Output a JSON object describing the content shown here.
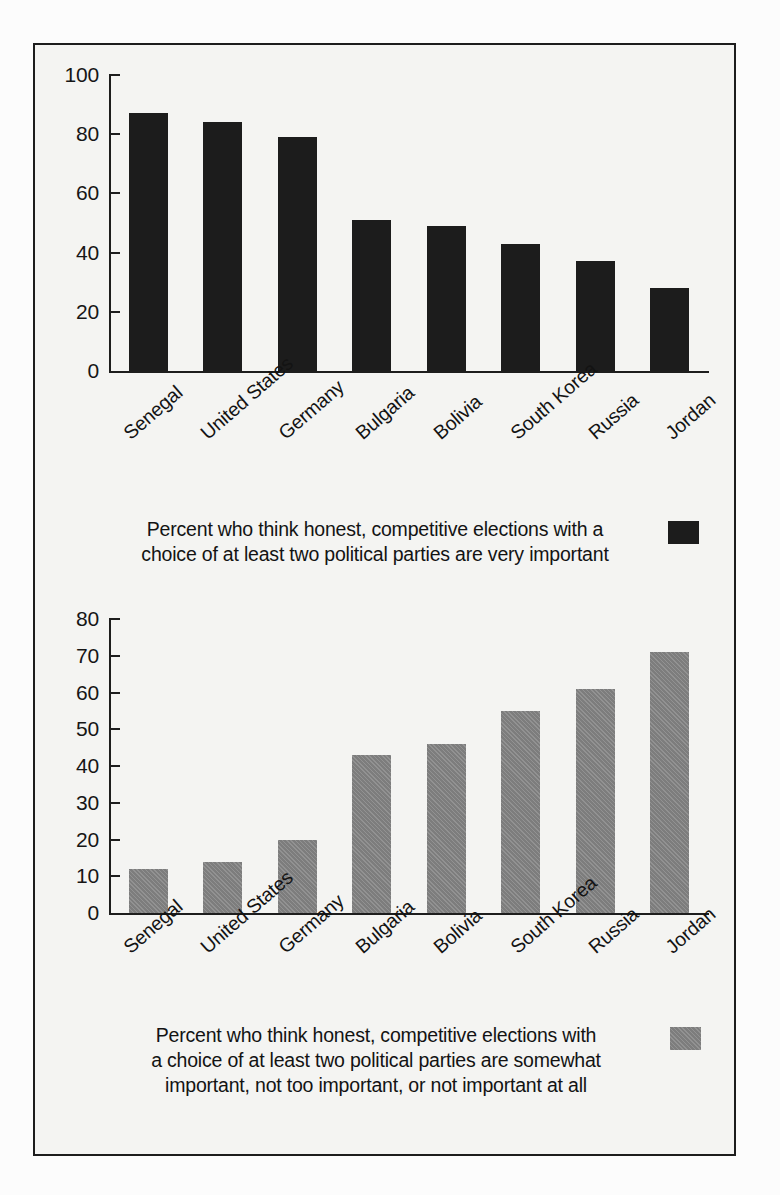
{
  "figure": {
    "background_color": "#f4f4f2",
    "border_color": "#1d1d1d",
    "dark_series_color": "#1c1c1c",
    "gray_series_color": "#7d7d7d"
  },
  "panels": [
    {
      "caption": "Percent who think honest, competitive elections with a choice of at least two political parties are very important",
      "caption_line1": "Percent who think honest, competitive elections with a",
      "caption_line2": "choice of at least two political parties are very important",
      "swatch": "dark-swatch"
    },
    {
      "caption": "Percent who think honest, competitive elections with a choice of at least two political parties are somewhat important, not too important, or not important at all",
      "caption_line1": "Percent who think honest, competitive elections with",
      "caption_line2": "a choice of at least two political parties are somewhat",
      "caption_line3": "important, not too important, or not important at all",
      "swatch": "gray-swatch"
    }
  ],
  "chart_data": [
    {
      "type": "bar",
      "title": "",
      "subtitle": "Percent who think honest, competitive elections with a choice of at least two political parties are very important",
      "categories": [
        "Senegal",
        "United States",
        "Germany",
        "Bulgaria",
        "Bolivia",
        "South Korea",
        "Russia",
        "Jordan"
      ],
      "values": [
        87,
        84,
        79,
        51,
        49,
        43,
        37,
        28
      ],
      "xlabel": "",
      "ylabel": "",
      "ylim": [
        0,
        100
      ],
      "yticks": [
        0,
        20,
        40,
        60,
        80,
        100
      ],
      "ytick_labels": [
        "0",
        "20",
        "40",
        "60",
        "80",
        "100"
      ],
      "grid": false,
      "legend": [
        "Percent who think honest, competitive elections with a choice of at least two political parties are very important"
      ],
      "legend_position": "bottom",
      "series_color": "#1c1c1c"
    },
    {
      "type": "bar",
      "title": "",
      "subtitle": "Percent who think honest, competitive elections with a choice of at least two political parties are somewhat important, not too important, or not important at all",
      "categories": [
        "Senegal",
        "United States",
        "Germany",
        "Bulgaria",
        "Bolivia",
        "South Korea",
        "Russia",
        "Jordan"
      ],
      "values": [
        12,
        14,
        20,
        43,
        46,
        55,
        61,
        71
      ],
      "xlabel": "",
      "ylabel": "",
      "ylim": [
        0,
        80
      ],
      "yticks": [
        0,
        10,
        20,
        30,
        40,
        50,
        60,
        70,
        80
      ],
      "ytick_labels": [
        "0",
        "10",
        "20",
        "30",
        "40",
        "50",
        "60",
        "70",
        "80"
      ],
      "grid": false,
      "legend": [
        "Percent who think honest, competitive elections with a choice of at least two political parties are somewhat important, not too important, or not important at all"
      ],
      "legend_position": "bottom",
      "series_color": "#7d7d7d"
    }
  ]
}
